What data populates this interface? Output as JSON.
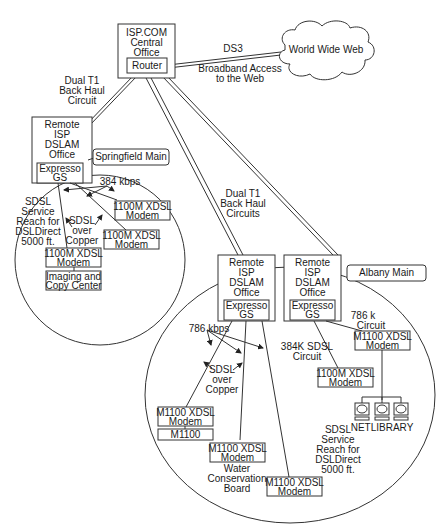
{
  "central_office": {
    "lines": [
      "ISP.COM",
      "Central",
      "Office"
    ],
    "router": "Router"
  },
  "internet": {
    "label": "World Wide Web",
    "link_top": "DS3",
    "link_bottom": [
      "Broadband Access",
      "to the Web"
    ]
  },
  "backhaul_left": [
    "Dual T1",
    "Back Haul",
    "Circuit"
  ],
  "backhaul_right": [
    "Dual T1",
    "Back Haul",
    "Circuits"
  ],
  "springfield": {
    "title": "Springfield Main",
    "office": [
      "Remote",
      "ISP",
      "DSLAM",
      "Office"
    ],
    "gs": [
      "Expresso",
      "GS"
    ],
    "speed": "384 kbps",
    "reach": [
      "SDSL",
      "Service",
      "Reach for",
      "DSLDirect",
      "5000 ft."
    ],
    "medium": [
      "SDSL",
      "over",
      "Copper"
    ],
    "modem1": [
      "1100M XDSL",
      "Modem"
    ],
    "modem2": [
      "1100M XDSL",
      "Modem"
    ],
    "modem3": [
      "1100M XDSL",
      "Modem"
    ],
    "site": [
      "Imaging and",
      "Copy Center"
    ]
  },
  "albany": {
    "title": "Albany Main",
    "office_a": [
      "Remote",
      "ISP",
      "DSLAM",
      "Office"
    ],
    "gs_a": [
      "Expresso",
      "GS"
    ],
    "office_b": [
      "Remote",
      "ISP",
      "DSLAM",
      "Office"
    ],
    "gs_b": [
      "Expresso",
      "GS"
    ],
    "speed": "786 kbps",
    "medium": [
      "SDSL",
      "over",
      "Copper"
    ],
    "circuit_786": [
      "786 k",
      "Circuit"
    ],
    "circuit_384": [
      "384K SDSL",
      "Circuit"
    ],
    "modem_a1": [
      "M1100 XDSL",
      "Modem"
    ],
    "device_m1100": "M1100",
    "modem_a2": [
      "M1100 XDSL",
      "Modem"
    ],
    "site_a2": [
      "Water",
      "Conservation",
      "Board"
    ],
    "modem_a3": [
      "M1100 XDSL",
      "Modem"
    ],
    "modem_b1": [
      "M1100 XDSL",
      "Modem"
    ],
    "modem_b2": [
      "1100M XDSL",
      "Modem"
    ],
    "netlibrary": "NETLIBRARY",
    "reach": [
      "SDSL",
      "Service",
      "Reach for",
      "DSLDirect",
      "5000 ft."
    ]
  },
  "caption_partial": " "
}
